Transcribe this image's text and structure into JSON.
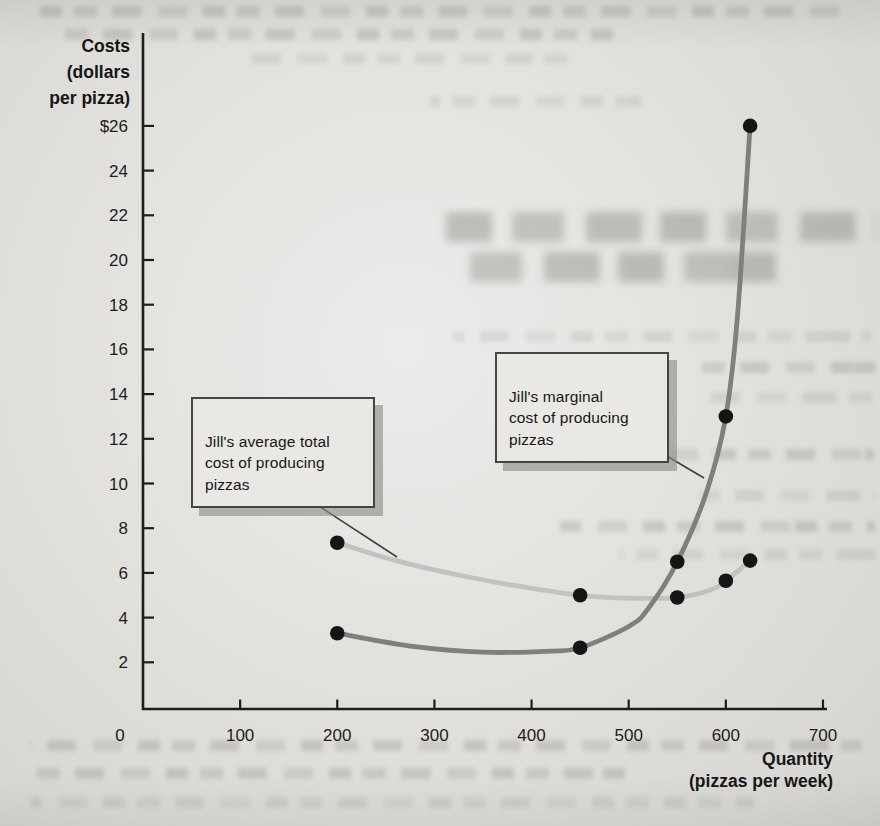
{
  "chart_data": {
    "type": "line",
    "title": "",
    "xlabel": "Quantity (pizzas per week)",
    "xlabel_lines": [
      "Quantity",
      "(pizzas per week)"
    ],
    "ylabel": "Costs (dollars per pizza)",
    "ylabel_lines": [
      "Costs",
      "(dollars",
      "per pizza)"
    ],
    "xlim": [
      0,
      700
    ],
    "ylim": [
      0,
      27
    ],
    "grid": false,
    "legend_position": "none",
    "x_ticks": [
      {
        "value": 0,
        "label": "0"
      },
      {
        "value": 100,
        "label": "100"
      },
      {
        "value": 200,
        "label": "200"
      },
      {
        "value": 300,
        "label": "300"
      },
      {
        "value": 400,
        "label": "400"
      },
      {
        "value": 500,
        "label": "500"
      },
      {
        "value": 600,
        "label": "600"
      },
      {
        "value": 700,
        "label": "700"
      }
    ],
    "y_ticks": [
      {
        "value": 26,
        "label": "$26"
      },
      {
        "value": 24,
        "label": "24"
      },
      {
        "value": 22,
        "label": "22"
      },
      {
        "value": 20,
        "label": "20"
      },
      {
        "value": 18,
        "label": "18"
      },
      {
        "value": 16,
        "label": "16"
      },
      {
        "value": 14,
        "label": "14"
      },
      {
        "value": 12,
        "label": "12"
      },
      {
        "value": 10,
        "label": "10"
      },
      {
        "value": 8,
        "label": "8"
      },
      {
        "value": 6,
        "label": "6"
      },
      {
        "value": 4,
        "label": "4"
      },
      {
        "value": 2,
        "label": "2"
      }
    ],
    "series": [
      {
        "name": "Jill's average total cost of producing pizzas",
        "color": "#c2c2c0",
        "curve_points": [
          [
            200,
            7.35
          ],
          [
            260,
            6.55
          ],
          [
            320,
            5.95
          ],
          [
            380,
            5.45
          ],
          [
            450,
            5.0
          ],
          [
            500,
            4.87
          ],
          [
            550,
            4.9
          ],
          [
            585,
            5.25
          ],
          [
            600,
            5.65
          ],
          [
            625,
            6.55
          ]
        ],
        "data_points": [
          [
            200,
            7.35
          ],
          [
            450,
            5.0
          ],
          [
            550,
            4.9
          ],
          [
            600,
            5.65
          ],
          [
            625,
            6.55
          ]
        ]
      },
      {
        "name": "Jill's marginal cost of producing pizzas",
        "color": "#7f7f7d",
        "curve_points": [
          [
            200,
            3.3
          ],
          [
            280,
            2.7
          ],
          [
            350,
            2.45
          ],
          [
            420,
            2.5
          ],
          [
            450,
            2.65
          ],
          [
            500,
            3.6
          ],
          [
            520,
            4.4
          ],
          [
            550,
            6.5
          ],
          [
            580,
            9.6
          ],
          [
            600,
            13.0
          ],
          [
            612,
            17.5
          ],
          [
            625,
            26.0
          ]
        ],
        "data_points": [
          [
            200,
            3.3
          ],
          [
            450,
            2.65
          ],
          [
            550,
            6.5
          ],
          [
            600,
            13.0
          ],
          [
            625,
            26.0
          ]
        ]
      }
    ],
    "annotations": [
      {
        "id": "atc",
        "text": "Jill's average total\ncost of producing\npizzas"
      },
      {
        "id": "mc",
        "text": "Jill's marginal\ncost of producing\npizzas"
      }
    ]
  }
}
